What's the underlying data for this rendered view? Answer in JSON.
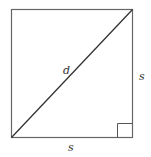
{
  "figure": {
    "labels": {
      "diagonal": "d",
      "right_side": "s",
      "bottom_side": "s"
    },
    "colors": {
      "stroke": "#555555",
      "diagonal": "#333333",
      "text": "#333333"
    }
  }
}
